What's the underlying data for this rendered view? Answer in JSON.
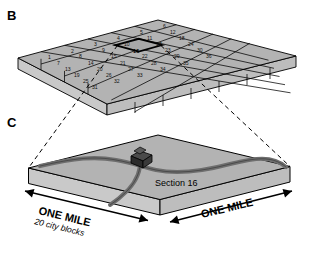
{
  "figure": {
    "panels": [
      {
        "id": "B",
        "letter": "B",
        "caption": ""
      },
      {
        "id": "C",
        "letter": "C",
        "caption": ""
      }
    ]
  },
  "township": {
    "rows": 6,
    "cols": 6,
    "total_sections": 36,
    "highlighted_section": 16,
    "numbering": [
      [
        1,
        2,
        3,
        4,
        5,
        6
      ],
      [
        7,
        8,
        9,
        10,
        11,
        12
      ],
      [
        13,
        14,
        15,
        16,
        17,
        18
      ],
      [
        19,
        20,
        21,
        22,
        23,
        24
      ],
      [
        25,
        26,
        27,
        28,
        29,
        30
      ],
      [
        31,
        32,
        33,
        34,
        35,
        36
      ]
    ]
  },
  "section_detail": {
    "label": "Section 16",
    "left_dimension": "ONE MILE",
    "left_sub_dimension": "20 city blocks",
    "right_dimension": "ONE MILE"
  },
  "colors": {
    "slab_top": "#b3b3b3",
    "slab_side": "#c9c9c9",
    "slab_front": "#bdbdbd",
    "road": "#6e6e6e",
    "outline": "#000000",
    "text": "#000000",
    "highlight_outline": "#000000"
  }
}
